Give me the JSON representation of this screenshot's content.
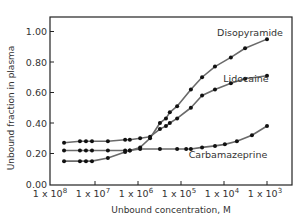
{
  "chart_data": {
    "type": "line",
    "title": "",
    "xlabel": "Unbound concentration, M",
    "ylabel": "Unbound fraction in plasma",
    "x_scale": "log",
    "x_tick_labels": [
      {
        "base": "1 x 10",
        "exp": "8",
        "pos": 8
      },
      {
        "base": "1 x 10",
        "exp": "7",
        "pos": 7
      },
      {
        "base": "1 x 10",
        "exp": "6",
        "pos": 6
      },
      {
        "base": "1 x 10",
        "exp": "5",
        "pos": 5
      },
      {
        "base": "1 x 10",
        "exp": "4",
        "pos": 4
      },
      {
        "base": "1 x 10",
        "exp": "3",
        "pos": 3
      }
    ],
    "xlim": [
      8,
      2.4
    ],
    "y_ticks": [
      0.0,
      0.2,
      0.4,
      0.6,
      0.8,
      1.0
    ],
    "y_tick_labels": [
      "0.00",
      "0.20",
      "0.40",
      "0.60",
      "0.80",
      "1.00"
    ],
    "ylim": [
      0,
      1.1
    ],
    "grid": false,
    "series": [
      {
        "name": "Disopyramide",
        "points": [
          [
            7.72,
            0.15
          ],
          [
            7.35,
            0.15
          ],
          [
            7.21,
            0.15
          ],
          [
            7.07,
            0.15
          ],
          [
            6.7,
            0.17
          ],
          [
            6.3,
            0.21
          ],
          [
            6.19,
            0.22
          ],
          [
            5.95,
            0.24
          ],
          [
            5.72,
            0.3
          ],
          [
            5.49,
            0.4
          ],
          [
            5.35,
            0.43
          ],
          [
            5.26,
            0.47
          ],
          [
            5.09,
            0.51
          ],
          [
            4.77,
            0.62
          ],
          [
            4.51,
            0.7
          ],
          [
            4.21,
            0.77
          ],
          [
            3.84,
            0.83
          ],
          [
            3.51,
            0.89
          ],
          [
            3.0,
            0.95
          ]
        ]
      },
      {
        "name": "Lidocaine",
        "points": [
          [
            7.72,
            0.27
          ],
          [
            7.35,
            0.28
          ],
          [
            7.21,
            0.28
          ],
          [
            7.07,
            0.28
          ],
          [
            6.7,
            0.28
          ],
          [
            6.3,
            0.29
          ],
          [
            6.19,
            0.29
          ],
          [
            5.95,
            0.3
          ],
          [
            5.72,
            0.31
          ],
          [
            5.49,
            0.36
          ],
          [
            5.35,
            0.38
          ],
          [
            5.26,
            0.4
          ],
          [
            5.09,
            0.43
          ],
          [
            4.77,
            0.5
          ],
          [
            4.51,
            0.58
          ],
          [
            4.21,
            0.62
          ],
          [
            3.84,
            0.66
          ],
          [
            3.51,
            0.69
          ],
          [
            3.0,
            0.71
          ]
        ]
      },
      {
        "name": "Carbamazeprine",
        "points": [
          [
            7.72,
            0.22
          ],
          [
            7.35,
            0.22
          ],
          [
            7.21,
            0.22
          ],
          [
            7.07,
            0.22
          ],
          [
            6.7,
            0.22
          ],
          [
            6.3,
            0.22
          ],
          [
            6.19,
            0.22
          ],
          [
            5.95,
            0.23
          ],
          [
            5.49,
            0.23
          ],
          [
            5.09,
            0.23
          ],
          [
            4.88,
            0.23
          ],
          [
            4.77,
            0.23
          ],
          [
            4.51,
            0.24
          ],
          [
            4.21,
            0.25
          ],
          [
            3.98,
            0.26
          ],
          [
            3.7,
            0.28
          ],
          [
            3.35,
            0.32
          ],
          [
            3.0,
            0.38
          ]
        ]
      }
    ],
    "series_labels": [
      {
        "series": "Disopyramide",
        "text": "Disopyramide"
      },
      {
        "series": "Lidocaine",
        "text": "Lidocaine"
      },
      {
        "series": "Carbamazeprine",
        "text": "Carbamazeprine"
      }
    ],
    "colors": {
      "line": "#6a6a6a",
      "marker": "#111111",
      "axis": "#222222"
    }
  }
}
